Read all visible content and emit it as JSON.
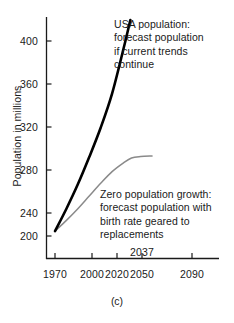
{
  "chart_data": {
    "type": "line",
    "title": "",
    "xlabel": "",
    "ylabel": "Population in millions",
    "caption": "(c)",
    "xlim": [
      1963,
      2100
    ],
    "ylim": [
      188,
      424
    ],
    "grid": false,
    "legend": "annotations-inline",
    "xticks": [
      1970,
      2000,
      2020,
      2050,
      2090
    ],
    "xtick_labels": [
      "1970",
      "2000",
      "2020",
      "2050",
      "2090"
    ],
    "extra_xtick": {
      "value": 2037,
      "label": "2037",
      "position": "above-axis"
    },
    "yticks": [
      200,
      240,
      280,
      320,
      360,
      400
    ],
    "ytick_labels": [
      "200",
      "240",
      "280",
      "320",
      "360",
      "400"
    ],
    "series": [
      {
        "name": "USA population: forecast population if current trends continue",
        "color": "#000000",
        "width": 2.6,
        "x": [
          1970,
          1980,
          1990,
          2000,
          2010,
          2020,
          2030,
          2036
        ],
        "values": [
          205,
          228,
          253,
          281,
          311,
          346,
          392,
          424
        ]
      },
      {
        "name": "Zero population growth: forecast population with birth rate geared to replacements",
        "color": "#8a8a8a",
        "width": 1.5,
        "x": [
          1970,
          1980,
          1990,
          2000,
          2010,
          2020,
          2030,
          2037,
          2045,
          2055
        ],
        "values": [
          205,
          216,
          228,
          241,
          254,
          266,
          275,
          280,
          281.5,
          282
        ]
      }
    ],
    "annotations": [
      {
        "id": "usa",
        "text": "USA population:\nforecast population\nif current trends\ncontinue",
        "target_series": "USA population: forecast population if current trends continue"
      },
      {
        "id": "zpg",
        "text": "Zero population growth:\nforecast population with\nbirth rate geared to\nreplacements",
        "target_series": "Zero population growth: forecast population with birth rate geared to replacements"
      }
    ]
  },
  "axis": {
    "y_title": "Population in millions",
    "caption": "(c)"
  }
}
